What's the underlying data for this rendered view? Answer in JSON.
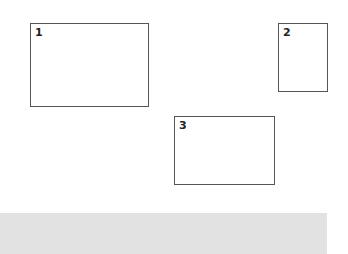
{
  "boxes": [
    {
      "label": "1"
    },
    {
      "label": "2"
    },
    {
      "label": "3"
    }
  ],
  "colors": {
    "box_border": "#555555",
    "bar_fill": "#e2e2e2"
  }
}
